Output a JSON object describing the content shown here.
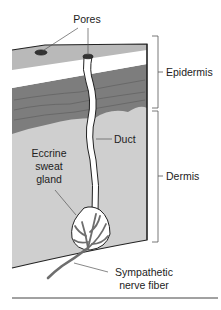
{
  "diagram": {
    "type": "anatomy-illustration",
    "labels": {
      "pores": "Pores",
      "epidermis": "Epidermis",
      "dermis": "Dermis",
      "duct": "Duct",
      "gland_line1": "Eccrine",
      "gland_line2": "sweat",
      "gland_line3": "gland",
      "nerve_line1": "Sympathetic",
      "nerve_line2": "nerve fiber"
    },
    "colors": {
      "stratum_corneum": "#b9b9b9",
      "clear_layer": "#ffffff",
      "basal_layer": "#7d7d7d",
      "dermis": "#cfcfcf",
      "outline": "#222222",
      "nerve": "#6e6e6e",
      "bracket": "#555555"
    }
  }
}
